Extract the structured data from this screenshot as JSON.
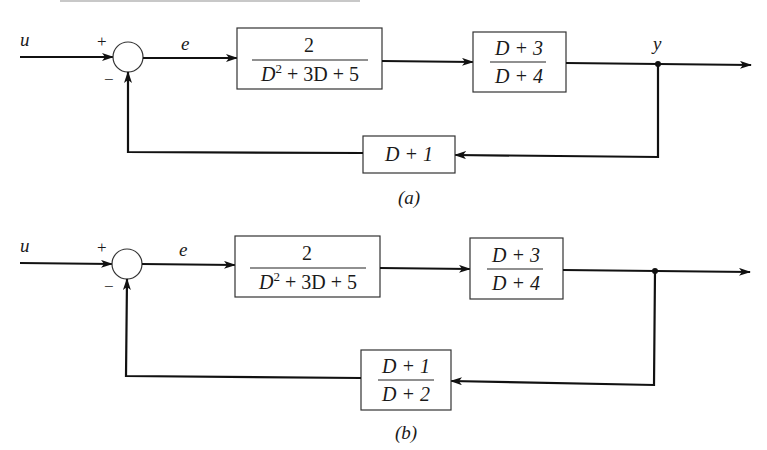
{
  "diagrams": [
    {
      "caption": "(a)",
      "input_label": "u",
      "error_label": "e",
      "output_label": "y",
      "sum_signs": {
        "plus": "+",
        "minus": "−"
      },
      "forward_block_1": {
        "numerator": "2",
        "denominator_parts": [
          "D",
          "2",
          " + 3D + 5"
        ]
      },
      "forward_block_2": {
        "numerator": "D + 3",
        "denominator": "D + 4"
      },
      "feedback_block": {
        "expression": "D + 1"
      }
    },
    {
      "caption": "(b)",
      "input_label": "u",
      "error_label": "e",
      "output_label": "",
      "sum_signs": {
        "plus": "+",
        "minus": "−"
      },
      "forward_block_1": {
        "numerator": "2",
        "denominator_parts": [
          "D",
          "2",
          " + 3D + 5"
        ]
      },
      "forward_block_2": {
        "numerator": "D + 3",
        "denominator": "D + 4"
      },
      "feedback_block": {
        "numerator": "D + 1",
        "denominator": "D + 2"
      }
    }
  ]
}
